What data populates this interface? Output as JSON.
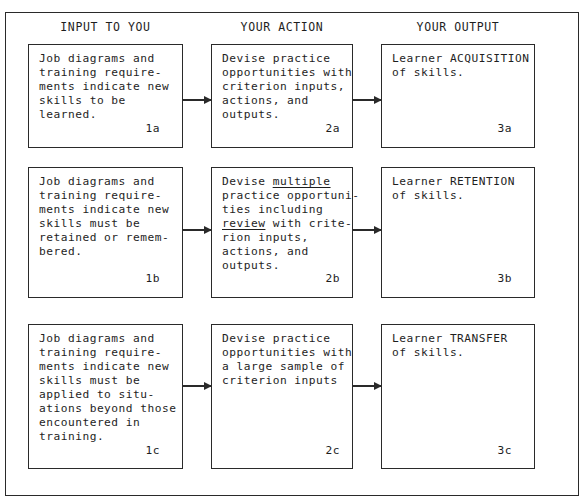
{
  "headers": {
    "input": "INPUT TO YOU",
    "action": "YOUR ACTION",
    "output": "YOUR OUTPUT"
  },
  "rows": [
    {
      "input": {
        "text": "Job diagrams and\ntraining require-\nments indicate new\nskills to be\nlearned.",
        "label": "1a"
      },
      "action": {
        "text": "Devise practice\nopportunities with\ncriterion inputs,\nactions, and\noutputs.",
        "label": "2a"
      },
      "output": {
        "text": "Learner ACQUISITION\nof skills.",
        "label": "3a"
      }
    },
    {
      "input": {
        "text": "Job diagrams and\ntraining require-\nments indicate new\nskills must be\nretained or remem-\nbered.",
        "label": "1b"
      },
      "action": {
        "line1_prefix": "Devise ",
        "line1_underlined": "multiple",
        "line2": "practice opportuni-",
        "line3": "ties including",
        "line4_underlined": "review",
        "line4_suffix": " with crite-",
        "line5": "rion inputs,",
        "line6": "actions, and",
        "line7": "outputs.",
        "label": "2b"
      },
      "output": {
        "text": "Learner RETENTION\nof skills.",
        "label": "3b"
      }
    },
    {
      "input": {
        "text": "Job diagrams and\ntraining require-\nments indicate new\nskills must be\napplied to situ-\nations beyond those\nencountered in\ntraining.",
        "label": "1c"
      },
      "action": {
        "text": "Devise practice\nopportunities with\na large sample of\ncriterion inputs",
        "label": "2c"
      },
      "output": {
        "text": "Learner TRANSFER\nof skills.",
        "label": "3c"
      }
    }
  ],
  "colors": {
    "line": "#2a2a2a",
    "text": "#1e1e1e",
    "background": "#ffffff"
  }
}
